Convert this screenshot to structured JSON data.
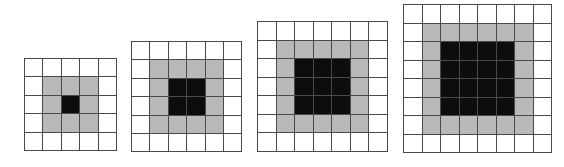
{
  "colors": {
    "white": "#ffffff",
    "gray": "#b9b9b9",
    "black": "#0d0d0d",
    "line": "#4a4a4a"
  },
  "grids": [
    {
      "id": "grid-5x5",
      "size": 5,
      "black_size": 1,
      "gray_size": 3,
      "left": 24,
      "top": 58,
      "cell": 18.4
    },
    {
      "id": "grid-6x6",
      "size": 6,
      "black_size": 2,
      "gray_size": 4,
      "left": 131,
      "top": 41,
      "cell": 18.4
    },
    {
      "id": "grid-7x7",
      "size": 7,
      "black_size": 3,
      "gray_size": 5,
      "left": 257,
      "top": 21,
      "cell": 18.5
    },
    {
      "id": "grid-8x8",
      "size": 8,
      "black_size": 4,
      "gray_size": 6,
      "left": 403,
      "top": 4,
      "cell": 18.5
    }
  ]
}
